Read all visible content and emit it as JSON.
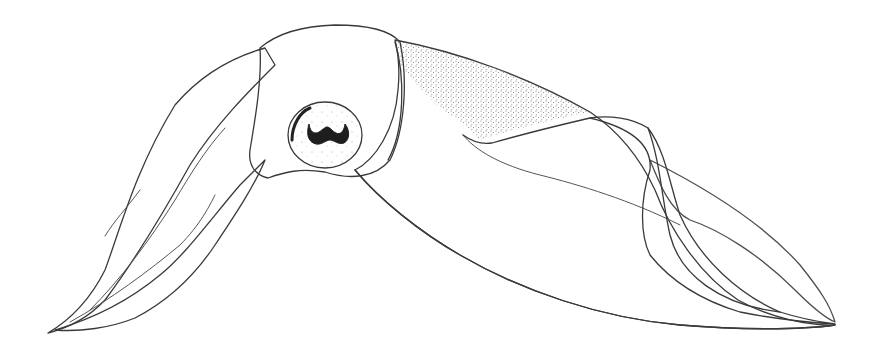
{
  "image": {
    "subject": "Stippled pen-and-ink illustration of a squid, lateral view",
    "background_color": "#ffffff",
    "ink_color": "#3a3a3a",
    "parts": [
      "arms",
      "head",
      "eye",
      "mantle",
      "fin"
    ]
  }
}
